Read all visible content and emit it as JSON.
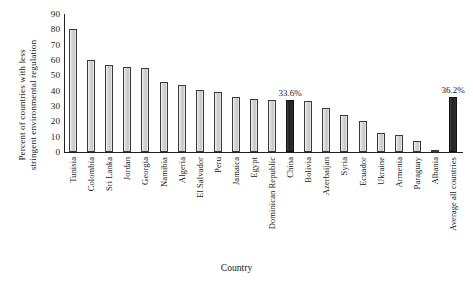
{
  "chart_data": {
    "type": "bar",
    "title": "",
    "xlabel": "Country",
    "ylabel_lines": [
      "Percent of countries with less",
      "stringent environmental regulation"
    ],
    "ylabel": "Percent of countries with less stringent environmental regulation",
    "ylim": [
      0,
      90
    ],
    "yticks": [
      0,
      10,
      20,
      30,
      40,
      50,
      60,
      70,
      80,
      90
    ],
    "grid": false,
    "legend": "none",
    "categories": [
      "Tunisia",
      "Colombia",
      "Sri Lanka",
      "Jordan",
      "Georgia",
      "Namibia",
      "Algeria",
      "El Salvador",
      "Peru",
      "Jamaica",
      "Egypt",
      "Dominican Republic",
      "China",
      "Bolivia",
      "Azerbaijan",
      "Syria",
      "Ecuador",
      "Ukraine",
      "Armenia",
      "Paraguay",
      "Albania",
      "Average all countries"
    ],
    "values": [
      80.0,
      60.3,
      57.0,
      55.5,
      54.8,
      45.4,
      43.4,
      40.5,
      39.3,
      36.0,
      34.6,
      34.0,
      33.6,
      33.2,
      29.0,
      24.0,
      20.5,
      12.5,
      11.0,
      7.0,
      1.2,
      36.2
    ],
    "highlighted": [
      "China",
      "Average all countries"
    ],
    "point_labels": {
      "China": "33.6%",
      "Average all countries": "36.2%"
    },
    "colors": {
      "bar_fill": "#d2d2d2",
      "bar_edge": "#3a3a3a",
      "highlight_fill": "#2b2b2b",
      "axis": "#222222",
      "text": "#1a1a1a",
      "background": "#ffffff"
    }
  }
}
